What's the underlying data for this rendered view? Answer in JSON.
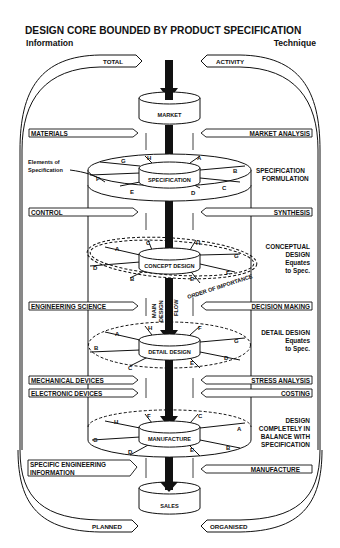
{
  "title": "DESIGN CORE BOUNDED BY PRODUCT SPECIFICATION",
  "subtitle_left": "Information",
  "subtitle_right": "Technique",
  "boundary_arrows": {
    "top_left": "TOTAL",
    "top_right": "ACTIVITY",
    "bottom_left": "PLANNED",
    "bottom_right": "ORGANISED"
  },
  "core_stages": [
    {
      "id": "market",
      "label": "MARKET"
    },
    {
      "id": "specification",
      "label": "SPECIFICATION"
    },
    {
      "id": "concept",
      "label": "CONCEPT DESIGN"
    },
    {
      "id": "detail",
      "label": "DETAIL DESIGN"
    },
    {
      "id": "manufacture",
      "label": "MANUFACTURE"
    },
    {
      "id": "sales",
      "label": "SALES"
    }
  ],
  "information_inputs": [
    {
      "label": "MATERIALS"
    },
    {
      "label": "CONTROL"
    },
    {
      "label": "ENGINEERING SCIENCE"
    },
    {
      "label": "MECHANICAL DEVICES"
    },
    {
      "label": "ELECTRONIC DEVICES"
    },
    {
      "label_line1": "SPECIFIC ENGINEERING",
      "label_line2": "INFORMATION"
    }
  ],
  "technique_inputs": [
    {
      "label": "MARKET ANALYSIS"
    },
    {
      "label": "SYNTHESIS"
    },
    {
      "label": "DECISION MAKING"
    },
    {
      "label": "STRESS ANALYSIS"
    },
    {
      "label": "COSTING"
    },
    {
      "label": "MANUFACTURE"
    }
  ],
  "annotations": {
    "elements_of_spec_line1": "Elements of",
    "elements_of_spec_line2": "Specification",
    "spec_formulation_line1": "SPECIFICATION",
    "spec_formulation_line2": "FORMULATION",
    "conceptual_line1": "CONCEPTUAL",
    "conceptual_line2": "DESIGN",
    "conceptual_line3": "Equates",
    "conceptual_line4": "to Spec.",
    "detail_line1": "DETAIL DESIGN",
    "detail_line2": "Equates",
    "detail_line3": "to Spec.",
    "balance_line1": "DESIGN",
    "balance_line2": "COMPLETELY IN",
    "balance_line3": "BALANCE WITH",
    "balance_line4": "SPECIFICATION",
    "order_of_importance": "ORDER OF IMPORTANCE",
    "main_flow_line1": "MAIN",
    "main_flow_line2": "DESIGN",
    "main_flow_line3": "FLOW"
  },
  "element_letters": [
    "A",
    "B",
    "C",
    "D",
    "E",
    "F",
    "G",
    "H"
  ],
  "colors": {
    "ink": "#111111",
    "paper": "#ffffff"
  }
}
